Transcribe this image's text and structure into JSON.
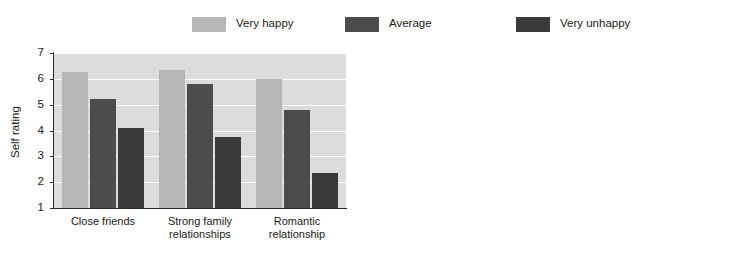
{
  "legend": {
    "entries": [
      {
        "label": "Very happy",
        "color": "#b6b6b6"
      },
      {
        "label": "Average",
        "color": "#4c4c4c"
      },
      {
        "label": "Very unhappy",
        "color": "#3a3a3a"
      }
    ]
  },
  "chart_data": [
    {
      "id": "self-rating",
      "type": "bar",
      "title": "",
      "xlabel": "",
      "ylabel": "Self rating",
      "ylim": [
        1,
        7
      ],
      "yticks": [
        1,
        2,
        3,
        4,
        5,
        6,
        7
      ],
      "ytick_labels": [
        "1",
        "2",
        "3",
        "4",
        "5",
        "6",
        "7"
      ],
      "grid": true,
      "legend_position": "top",
      "plot_background": "#dcdcdc",
      "gridline_color": "#ffffff",
      "categories": [
        "Close friends",
        "Strong family relationships",
        "Romantic relationship"
      ],
      "category_lines": [
        [
          "Close friends"
        ],
        [
          "Strong family",
          "relationships"
        ],
        [
          "Romantic",
          "relationship"
        ]
      ],
      "series": [
        {
          "name": "Very happy",
          "color": "#b6b6b6",
          "values": [
            6.25,
            6.35,
            6.0
          ]
        },
        {
          "name": "Average",
          "color": "#4c4c4c",
          "values": [
            5.2,
            5.8,
            4.8
          ]
        },
        {
          "name": "Very unhappy",
          "color": "#3a3a3a",
          "values": [
            4.1,
            3.75,
            2.35
          ]
        }
      ]
    },
    {
      "id": "daily-activity",
      "type": "bar",
      "title": "",
      "xlabel": "",
      "ylabel": "Daily activity score",
      "ylim": [
        0,
        8.6
      ],
      "yticks": [
        0,
        2,
        4,
        6,
        8
      ],
      "ytick_labels": [
        "0",
        "2",
        "4",
        "6",
        "8"
      ],
      "grid": true,
      "legend_position": "top",
      "plot_background": "#c4c4c4",
      "gridline_color": "#ffffff",
      "categories": [
        "Time spent alone",
        "Time spent with family, friends, and romantic partner"
      ],
      "category_lines": [
        [
          "Time spent",
          "alone"
        ],
        [
          "Time spent with",
          "family, friends, and",
          "romantic partner"
        ]
      ],
      "series": [
        {
          "name": "Very happy",
          "color": "#b6b6b6",
          "values": [
            4.4,
            5.2
          ]
        },
        {
          "name": "Average",
          "color": "#4c4c4c",
          "values": [
            5.0,
            4.55
          ]
        },
        {
          "name": "Very unhappy",
          "color": "#3a3a3a",
          "values": [
            5.8,
            3.65
          ]
        }
      ]
    }
  ]
}
